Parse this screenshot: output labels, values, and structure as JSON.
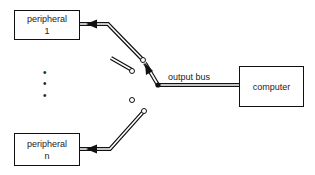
{
  "diagram": {
    "nodes": {
      "peripheral_1": {
        "line1": "peripheral",
        "line2": "1"
      },
      "peripheral_n": {
        "line1": "peripheral",
        "line2": "n"
      },
      "computer": {
        "label": "computer"
      }
    },
    "edges": {
      "output_bus": {
        "label": "output bus"
      }
    },
    "ellipsis": [
      "•",
      "•",
      "•"
    ],
    "colors": {
      "stroke": "#111111",
      "background": "#ffffff"
    }
  }
}
